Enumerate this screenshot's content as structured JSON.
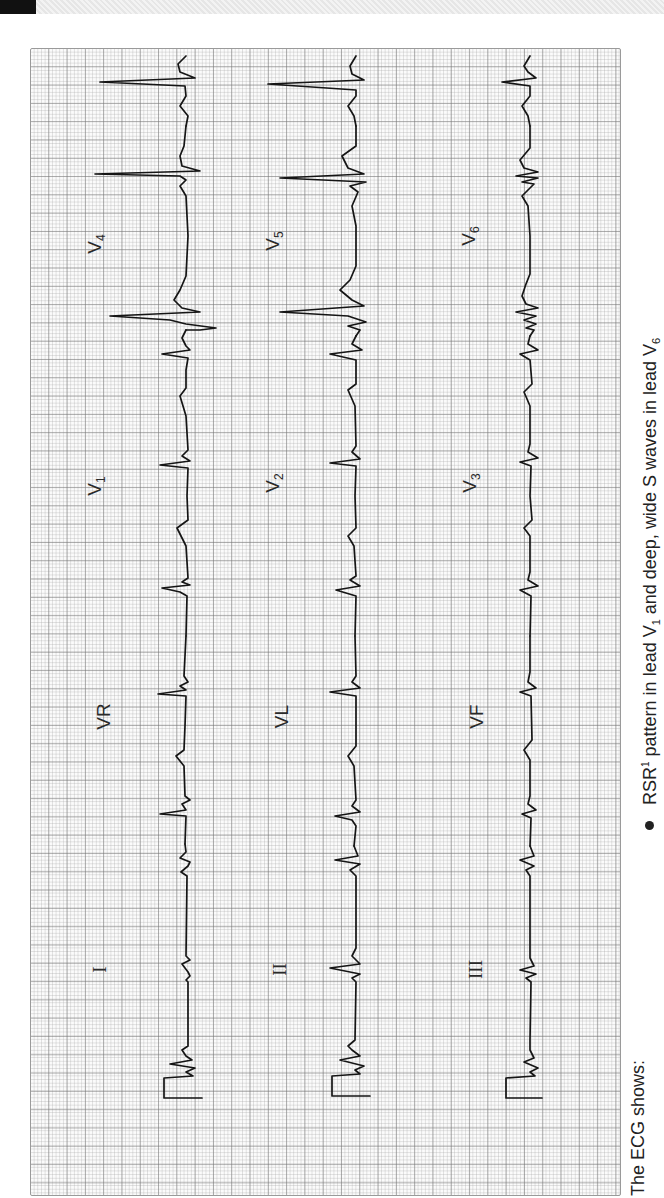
{
  "page": {
    "header_tab_color": "#111111",
    "paper_grid": {
      "large_square_px": 18.3,
      "small_square_px": 3.66,
      "line_color": "#8c8c8c",
      "trace_color": "#111111"
    }
  },
  "ecg": {
    "orientation": "rotated 90deg counter-clockwise",
    "rows": [
      {
        "leads": [
          "I",
          "VR",
          "V1",
          "V4"
        ]
      },
      {
        "leads": [
          "II",
          "VL",
          "V2",
          "V5"
        ]
      },
      {
        "leads": [
          "III",
          "VF",
          "V3",
          "V6"
        ]
      }
    ],
    "labels": {
      "I": "I",
      "II": "II",
      "III": "III",
      "VR": "VR",
      "VL": "VL",
      "VF": "VF",
      "V1": {
        "base": "V",
        "sub": "1"
      },
      "V2": {
        "base": "V",
        "sub": "2"
      },
      "V3": {
        "base": "V",
        "sub": "3"
      },
      "V4": {
        "base": "V",
        "sub": "4"
      },
      "V5": {
        "base": "V",
        "sub": "5"
      },
      "V6": {
        "base": "V",
        "sub": "6"
      }
    }
  },
  "caption": {
    "intro": "The ECG shows:",
    "bullets": [
      {
        "pre": "RSR",
        "sup": "1",
        "mid": " pattern in lead V",
        "sub1": "1",
        "post": " and deep, wide S waves in lead V",
        "sub2": "6"
      }
    ]
  }
}
